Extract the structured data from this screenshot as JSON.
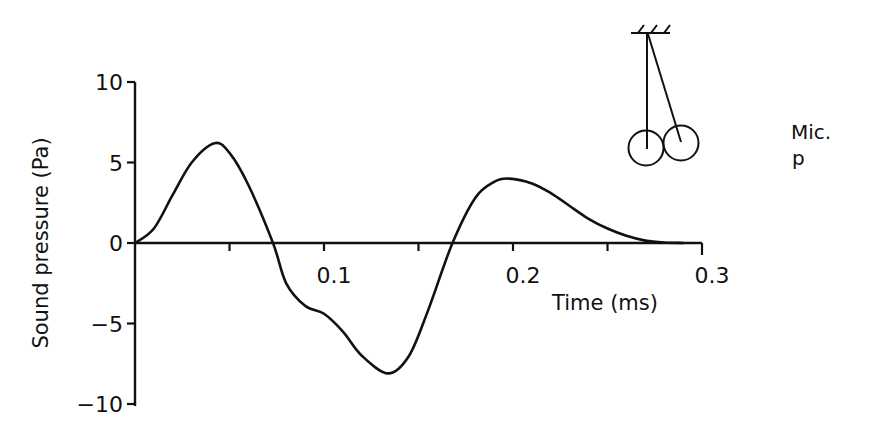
{
  "chart_data": {
    "type": "line",
    "title": "",
    "xlabel": "Time (ms)",
    "ylabel": "Sound pressure (Pa)",
    "xlim": [
      0,
      0.3
    ],
    "ylim": [
      -10,
      10
    ],
    "x_ticks": [
      0.05,
      0.1,
      0.15,
      0.2,
      0.25,
      0.3
    ],
    "x_tick_labels": [
      {
        "value": 0.1,
        "label": "0.1"
      },
      {
        "value": 0.2,
        "label": "0.2"
      },
      {
        "value": 0.3,
        "label": "0.3"
      }
    ],
    "y_ticks": [
      {
        "value": 10,
        "label": "10"
      },
      {
        "value": 5,
        "label": "5"
      },
      {
        "value": 0,
        "label": "0"
      },
      {
        "value": -5,
        "label": "-5"
      },
      {
        "value": -10,
        "label": "-10"
      }
    ],
    "grid": false,
    "legend": null,
    "series": [
      {
        "name": "Sound pressure",
        "x": [
          0,
          0.01,
          0.02,
          0.03,
          0.042,
          0.05,
          0.06,
          0.073,
          0.08,
          0.09,
          0.1,
          0.11,
          0.12,
          0.134,
          0.145,
          0.155,
          0.168,
          0.18,
          0.19,
          0.198,
          0.21,
          0.22,
          0.23,
          0.24,
          0.25,
          0.26,
          0.27,
          0.28,
          0.29
        ],
        "y": [
          0,
          0.9,
          3.0,
          5.0,
          6.2,
          5.6,
          3.6,
          0,
          -2.5,
          -3.9,
          -4.4,
          -5.5,
          -7.0,
          -8.1,
          -7.0,
          -4.2,
          0,
          2.8,
          3.8,
          4.0,
          3.7,
          3.1,
          2.3,
          1.5,
          0.9,
          0.45,
          0.15,
          0.03,
          0
        ]
      }
    ],
    "annotations": {
      "mic_label": "Mic.",
      "mic_sub": "p",
      "illustration": "pendulum-two-spheres"
    }
  }
}
